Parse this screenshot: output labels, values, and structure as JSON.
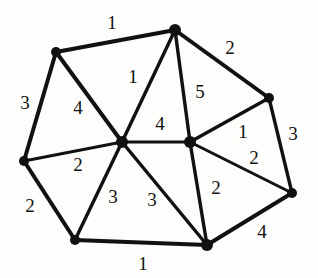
{
  "figure": {
    "kind": "weighted-undirected-graph",
    "title": "",
    "background_color": "#fdfdfb",
    "edge_color": "#111111",
    "node_color": "#111111",
    "label_color": "#111111"
  },
  "nodes": [
    {
      "id": "n-top-left",
      "name": "node-top-left",
      "x": 56,
      "y": 52,
      "r": 5
    },
    {
      "id": "n-top",
      "name": "node-top",
      "x": 175,
      "y": 30,
      "r": 6
    },
    {
      "id": "n-right-upper",
      "name": "node-right-upper",
      "x": 269,
      "y": 98,
      "r": 5
    },
    {
      "id": "n-right-far",
      "name": "node-right-far",
      "x": 292,
      "y": 193,
      "r": 5
    },
    {
      "id": "n-bottom-right",
      "name": "node-bottom-right",
      "x": 207,
      "y": 245,
      "r": 6
    },
    {
      "id": "n-bottom-left",
      "name": "node-bottom-left",
      "x": 75,
      "y": 240,
      "r": 5
    },
    {
      "id": "n-left",
      "name": "node-left",
      "x": 24,
      "y": 161,
      "r": 5
    },
    {
      "id": "n-center",
      "name": "node-center",
      "x": 122,
      "y": 142,
      "r": 6
    },
    {
      "id": "n-mid-right",
      "name": "node-mid-right",
      "x": 190,
      "y": 142,
      "r": 6
    }
  ],
  "edges": [
    {
      "id": "e1",
      "name": "edge-top-left-to-top",
      "from": "n-top-left",
      "to": "n-top",
      "weight": "1",
      "label_x": 112,
      "label_y": 22,
      "width": 4.0
    },
    {
      "id": "e2",
      "name": "edge-top-to-right-upper",
      "from": "n-top",
      "to": "n-right-upper",
      "weight": "2",
      "label_x": 230,
      "label_y": 47,
      "width": 4.0
    },
    {
      "id": "e3",
      "name": "edge-top-left-to-left",
      "from": "n-top-left",
      "to": "n-left",
      "weight": "3",
      "label_x": 25,
      "label_y": 102,
      "width": 4.0
    },
    {
      "id": "e4",
      "name": "edge-top-left-to-center",
      "from": "n-top-left",
      "to": "n-center",
      "weight": "4",
      "label_x": 78,
      "label_y": 107,
      "width": 4.0
    },
    {
      "id": "e5",
      "name": "edge-top-to-center",
      "from": "n-top",
      "to": "n-center",
      "weight": "1",
      "label_x": 133,
      "label_y": 76,
      "width": 3.4
    },
    {
      "id": "e6",
      "name": "edge-top-to-mid-right",
      "from": "n-top",
      "to": "n-mid-right",
      "weight": "5",
      "label_x": 200,
      "label_y": 91,
      "width": 3.4
    },
    {
      "id": "e7",
      "name": "edge-center-to-mid-right",
      "from": "n-center",
      "to": "n-mid-right",
      "weight": "4",
      "label_x": 160,
      "label_y": 123,
      "width": 3.0
    },
    {
      "id": "e8",
      "name": "edge-right-upper-to-mid-right",
      "from": "n-right-upper",
      "to": "n-mid-right",
      "weight": "1",
      "label_x": 243,
      "label_y": 131,
      "width": 3.4
    },
    {
      "id": "e9",
      "name": "edge-right-upper-to-right-far",
      "from": "n-right-upper",
      "to": "n-right-far",
      "weight": "3",
      "label_x": 293,
      "label_y": 133,
      "width": 3.4
    },
    {
      "id": "e10",
      "name": "edge-mid-right-to-right-far",
      "from": "n-mid-right",
      "to": "n-right-far",
      "weight": "2",
      "label_x": 254,
      "label_y": 157,
      "width": 3.0
    },
    {
      "id": "e11",
      "name": "edge-left-to-center",
      "from": "n-left",
      "to": "n-center",
      "weight": "2",
      "label_x": 78,
      "label_y": 164,
      "width": 3.0
    },
    {
      "id": "e12",
      "name": "edge-left-to-bottom-left",
      "from": "n-left",
      "to": "n-bottom-left",
      "weight": "2",
      "label_x": 30,
      "label_y": 205,
      "width": 4.0
    },
    {
      "id": "e13",
      "name": "edge-bottom-left-to-center",
      "from": "n-bottom-left",
      "to": "n-center",
      "weight": "3",
      "label_x": 113,
      "label_y": 196,
      "width": 3.4
    },
    {
      "id": "e14",
      "name": "edge-center-to-bottom-right",
      "from": "n-center",
      "to": "n-bottom-right",
      "weight": "3",
      "label_x": 152,
      "label_y": 199,
      "width": 3.4
    },
    {
      "id": "e15",
      "name": "edge-mid-right-to-bottom-right",
      "from": "n-mid-right",
      "to": "n-bottom-right",
      "weight": "2",
      "label_x": 216,
      "label_y": 187,
      "width": 3.4
    },
    {
      "id": "e16",
      "name": "edge-bottom-right-to-right-far",
      "from": "n-bottom-right",
      "to": "n-right-far",
      "weight": "4",
      "label_x": 262,
      "label_y": 231,
      "width": 4.0
    },
    {
      "id": "e17",
      "name": "edge-bottom-left-to-bottom-right",
      "from": "n-bottom-left",
      "to": "n-bottom-right",
      "weight": "1",
      "label_x": 143,
      "label_y": 263,
      "width": 4.0
    }
  ]
}
